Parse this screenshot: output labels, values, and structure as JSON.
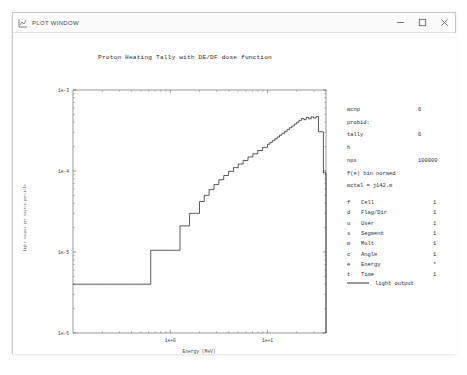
{
  "window": {
    "title": "PLOT WINDOW",
    "icon": "plot-window-icon",
    "controls": {
      "minimize": "minimize-icon",
      "maximize": "maximize-icon",
      "close": "close-icon"
    }
  },
  "chart_data": {
    "type": "line",
    "title": "Proton Heating Tally with DE/DF dose function",
    "xlabel": "Energy (MeV)",
    "ylabel": "light output per source particle",
    "xscale": "log",
    "yscale": "log",
    "xlim": [
      0.1,
      40
    ],
    "ylim": [
      1e-06,
      0.001
    ],
    "xticklabels": [
      "1e+0",
      "1e+1"
    ],
    "xtickvalues": [
      1,
      10
    ],
    "yticklabels": [
      "1e-3",
      "1e-4",
      "1e-5",
      "1e-6"
    ],
    "ytickvalues": [
      0.001,
      0.0001,
      1e-05,
      1e-06
    ],
    "grid": false,
    "legend_position": "right",
    "series": [
      {
        "name": "light output",
        "drawstyle": "steps-post",
        "color": "#000000",
        "x": [
          0.1,
          0.16,
          0.25,
          0.4,
          0.63,
          1.0,
          1.26,
          1.58,
          2.0,
          2.24,
          2.51,
          2.82,
          3.16,
          3.55,
          3.98,
          4.47,
          5.01,
          5.62,
          6.31,
          7.08,
          7.94,
          8.91,
          10.0,
          10.6,
          11.2,
          11.9,
          12.6,
          13.3,
          14.1,
          15.0,
          15.9,
          16.8,
          17.8,
          18.9,
          20.0,
          21.1,
          22.4,
          23.7,
          25.1,
          26.6,
          28.2,
          29.9,
          31.6,
          33.5,
          35.5,
          37.6,
          39.8
        ],
        "y": [
          4e-06,
          4e-06,
          4e-06,
          4e-06,
          1.05e-05,
          1.05e-05,
          2.1e-05,
          3e-05,
          4.2e-05,
          5e-05,
          5.9e-05,
          6.8e-05,
          7.8e-05,
          8.8e-05,
          9.9e-05,
          0.00011,
          0.000122,
          0.000135,
          0.000149,
          0.000163,
          0.000179,
          0.000196,
          0.000214,
          0.000225,
          0.000237,
          0.00025,
          0.000263,
          0.000277,
          0.000292,
          0.000308,
          0.000325,
          0.000342,
          0.00036,
          0.00038,
          0.0004,
          0.000422,
          0.000445,
          0.00043,
          0.00046,
          0.00044,
          0.000465,
          0.00045,
          0.00047,
          0.000305,
          0.000305,
          9.5e-05,
          9.5e-05
        ]
      }
    ]
  },
  "info_panel": {
    "lines": [
      {
        "label": "mcnp",
        "value": "6"
      },
      {
        "label": "probid:",
        "value": ""
      },
      {
        "label": "tally",
        "value": "6"
      },
      {
        "label": "h",
        "value": ""
      },
      {
        "label": "nps",
        "value": "100000"
      },
      {
        "label": "f(e) bin normed",
        "value": ""
      },
      {
        "label": "mctal = j142.m",
        "value": ""
      }
    ],
    "bins": [
      {
        "key": "f",
        "name": "Cell",
        "value": "1"
      },
      {
        "key": "d",
        "name": "Flag/Dir",
        "value": "1"
      },
      {
        "key": "u",
        "name": "User",
        "value": "1"
      },
      {
        "key": "s",
        "name": "Segment",
        "value": "1"
      },
      {
        "key": "m",
        "name": "Mult",
        "value": "1"
      },
      {
        "key": "c",
        "name": "Angle",
        "value": "1"
      },
      {
        "key": "e",
        "name": "Energy",
        "value": "*"
      },
      {
        "key": "t",
        "name": "Time",
        "value": "1"
      }
    ],
    "legend": {
      "swatch_color": "#000000",
      "label": "light output"
    }
  }
}
